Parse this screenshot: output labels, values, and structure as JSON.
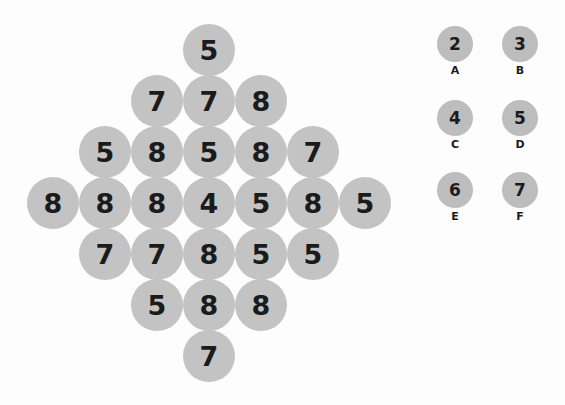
{
  "puzzle": {
    "rows": [
      [
        "5"
      ],
      [
        "7",
        "7",
        "8"
      ],
      [
        "5",
        "8",
        "5",
        "8",
        "7"
      ],
      [
        "8",
        "8",
        "8",
        "4",
        "5",
        "8",
        "5"
      ],
      [
        "7",
        "7",
        "8",
        "5",
        "5"
      ],
      [
        "5",
        "8",
        "8"
      ],
      [
        "7"
      ]
    ]
  },
  "options": [
    {
      "value": "2",
      "label": "A"
    },
    {
      "value": "3",
      "label": "B"
    },
    {
      "value": "4",
      "label": "C"
    },
    {
      "value": "5",
      "label": "D"
    },
    {
      "value": "6",
      "label": "E"
    },
    {
      "value": "7",
      "label": "F"
    }
  ]
}
